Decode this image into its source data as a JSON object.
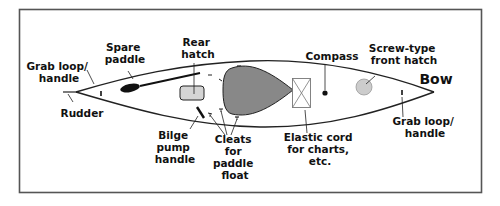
{
  "colors": {
    "frame": "#555555",
    "hull_line": "#222222",
    "cockpit_fill": "#888888",
    "rear_hatch_fill": "#d4d4d4",
    "front_hatch_fill": "#cccccc",
    "paddle_blade": "#111111",
    "label_text": "#111111"
  },
  "labels": {
    "grab_loop_stern": [
      "Grab loop/",
      "handle"
    ],
    "spare_paddle": [
      "Spare",
      "paddle"
    ],
    "rear_hatch": [
      "Rear",
      "hatch"
    ],
    "compass": [
      "Compass"
    ],
    "front_hatch": [
      "Screw-type",
      "front hatch"
    ],
    "bow": "Bow",
    "rudder": [
      "Rudder"
    ],
    "bilge_pump": [
      "Bilge",
      "pump",
      "handle"
    ],
    "cleats": [
      "Cleats",
      "for",
      "paddle",
      "float"
    ],
    "elastic_cord": [
      "Elastic cord",
      "for charts,",
      "etc."
    ],
    "grab_loop_bow": [
      "Grab loop/",
      "handle"
    ]
  }
}
